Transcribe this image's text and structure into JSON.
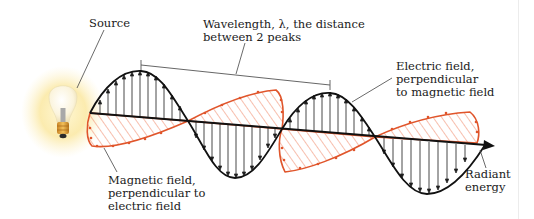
{
  "diagram": {
    "labels": {
      "source": "Source",
      "wavelength": "Wavelength, λ, the distance\nbetween 2 peaks",
      "electric_field": "Electric field,\nperpendicular\nto magnetic field",
      "magnetic_field": "Magnetic field,\nperpendicular to\nelectric field",
      "radiant_energy": "Radiant\nenergy"
    },
    "components": [
      {
        "id": "light-bulb",
        "description": "Glowing light bulb (source)"
      },
      {
        "id": "electric-wave",
        "description": "Black sinusoid with vertical arrows",
        "color": "#111111"
      },
      {
        "id": "magnetic-wave",
        "description": "Red hatched sinusoid perpendicular to electric field",
        "color": "#e0552b"
      },
      {
        "id": "propagation-axis",
        "description": "Arrow pointing in direction of radiant energy",
        "color": "#111111"
      },
      {
        "id": "wavelength-bracket",
        "description": "Bracket spanning between two electric-field peaks",
        "color": "#555555"
      }
    ],
    "colors": {
      "electric": "#111111",
      "magnetic": "#e0552b",
      "magnetic_hatch": "#f08a6a",
      "glow": "#fbe9a6",
      "bulb_base": "#e3a53c",
      "leader_line": "#444444"
    }
  }
}
